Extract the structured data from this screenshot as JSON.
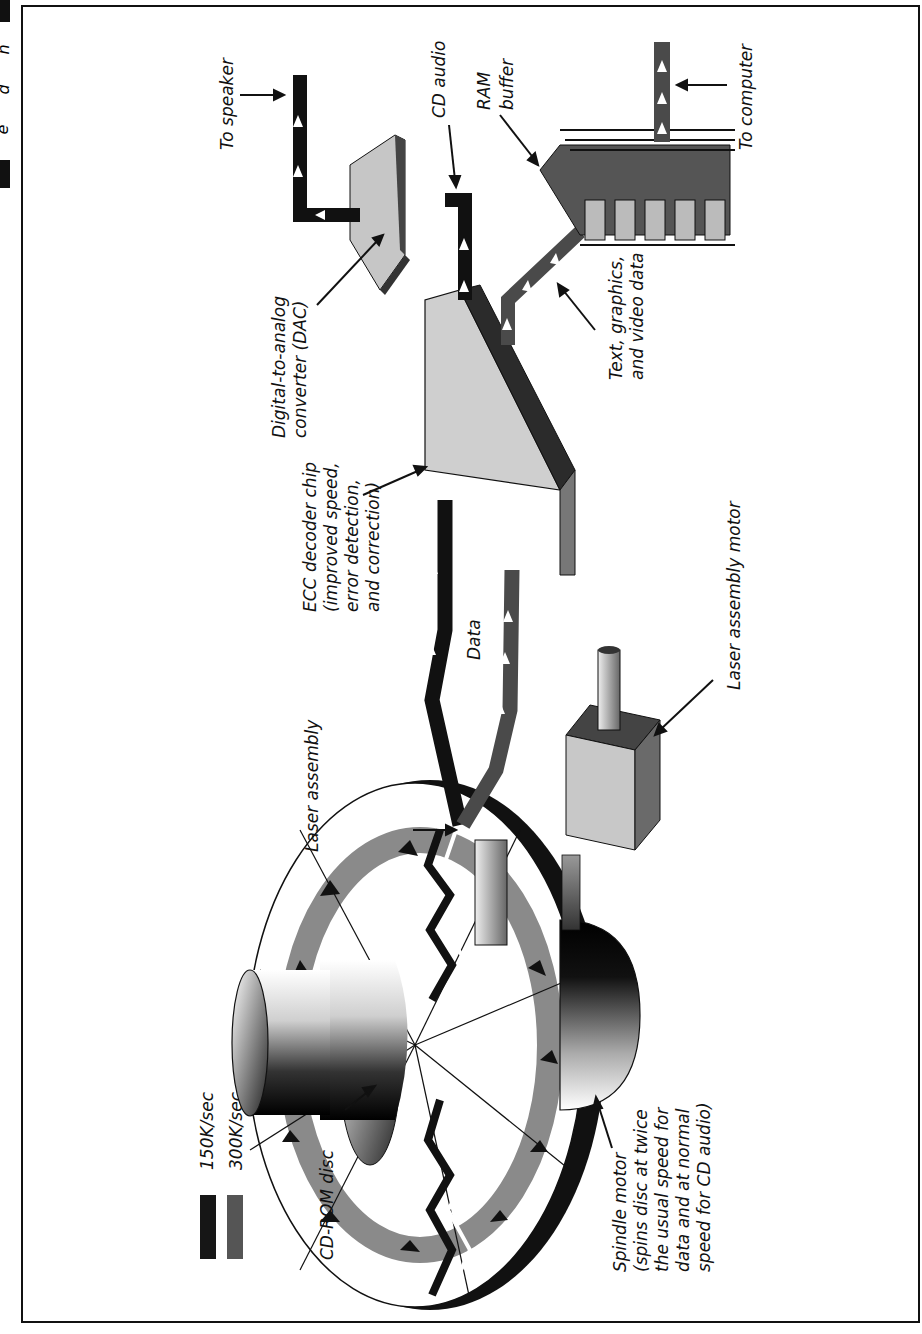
{
  "figure": {
    "legend": [
      {
        "label": "150K/sec",
        "color": "#161616"
      },
      {
        "label": "300K/sec",
        "color": "#555555"
      }
    ],
    "labels": {
      "to_speaker": "To speaker",
      "cd_audio": "CD audio",
      "ram_buffer": [
        "RAM",
        "buffer"
      ],
      "to_computer": "To computer",
      "dac": [
        "Digital-to-analog",
        "converter (DAC)"
      ],
      "text_graphics": [
        "Text, graphics,",
        "and video data"
      ],
      "ecc": [
        "ECC decoder chip",
        "(improved speed,",
        "error detection,",
        "and correction)"
      ],
      "data": "Data",
      "laser_assembly": "Laser assembly",
      "laser_motor": "Laser assembly motor",
      "cdrom_disc": "CD-ROM disc",
      "spindle": [
        "Spindle motor",
        "(spins disc at twice",
        "the usual speed for",
        "data and at normal",
        "speed for CD audio)"
      ]
    },
    "page_edge_glyphs": [
      "n",
      "d",
      "e"
    ]
  }
}
